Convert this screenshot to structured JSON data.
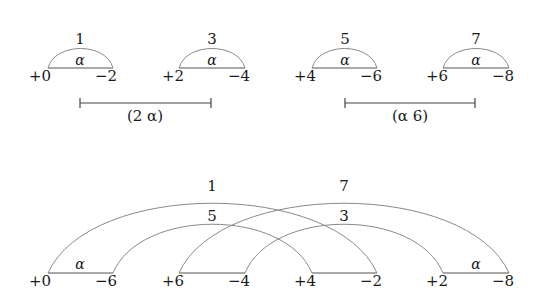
{
  "top_row": {
    "arcs": [
      {
        "label": "1",
        "inner": "α",
        "left": "+0",
        "right": "−2"
      },
      {
        "label": "3",
        "inner": "α",
        "left": "+2",
        "right": "−4"
      },
      {
        "label": "5",
        "inner": "α",
        "left": "+4",
        "right": "−6"
      },
      {
        "label": "7",
        "inner": "α",
        "left": "+6",
        "right": "−8"
      }
    ],
    "brackets": [
      {
        "label": "(2 α)"
      },
      {
        "label": "(α 6)"
      }
    ]
  },
  "bottom_row": {
    "nodes": [
      "+0",
      "−6",
      "+6",
      "−4",
      "+4",
      "−2",
      "+2",
      "−8"
    ],
    "segment_labels": [
      "α",
      "α"
    ],
    "arcs": [
      {
        "label": "1"
      },
      {
        "label": "5"
      },
      {
        "label": "7"
      },
      {
        "label": "3"
      }
    ]
  }
}
